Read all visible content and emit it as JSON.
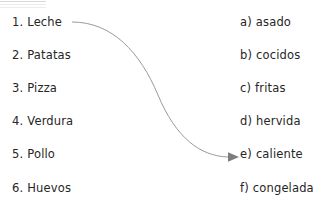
{
  "worksheet": {
    "background_color": "#ffffff",
    "text_color": "#262626",
    "left_column": [
      {
        "marker": "1.",
        "label": "Leche",
        "top": 14
      },
      {
        "marker": "2.",
        "label": "Patatas",
        "top": 47
      },
      {
        "marker": "3.",
        "label": "Pizza",
        "top": 80
      },
      {
        "marker": "4.",
        "label": "Verdura",
        "top": 113
      },
      {
        "marker": "5.",
        "label": "Pollo",
        "top": 146
      },
      {
        "marker": "6.",
        "label": "Huevos",
        "top": 180
      }
    ],
    "right_column": [
      {
        "marker": "a)",
        "label": "asado",
        "top": 14
      },
      {
        "marker": "b)",
        "label": "cocidos",
        "top": 47
      },
      {
        "marker": "c)",
        "label": "fritas",
        "top": 80
      },
      {
        "marker": "d)",
        "label": "hervida",
        "top": 113
      },
      {
        "marker": "e)",
        "label": "caliente",
        "top": 146
      },
      {
        "marker": "f)",
        "label": "congelada",
        "top": 180
      }
    ],
    "connection": {
      "from": "1. Leche",
      "to": "e) caliente",
      "stroke_color": "#9a9a9a",
      "arrowhead_color": "#7d7d7d",
      "path": "M 72 22 C 112 22, 140 52, 158 95 C 176 138, 200 156, 228 157",
      "arrowhead": "M 228 152.2 L 239 157 L 228 161.8 Z"
    }
  }
}
